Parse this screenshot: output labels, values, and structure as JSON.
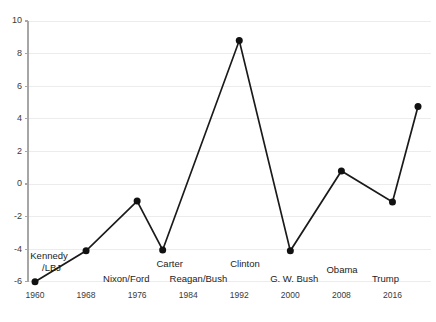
{
  "chart_data": {
    "type": "line",
    "title": "",
    "subtitle": "",
    "xlabel": "",
    "ylabel": "",
    "xlim": [
      1958,
      2022
    ],
    "ylim": [
      -6,
      10
    ],
    "grid": true,
    "legend": "none",
    "x_ticks": [
      "1960",
      "1968",
      "1976",
      "1984",
      "1992",
      "2000",
      "2008",
      "2016"
    ],
    "x_tick_values": [
      1960,
      1968,
      1976,
      1984,
      1992,
      2000,
      2008,
      2016
    ],
    "y_ticks": [
      "-6",
      "-4",
      "-2",
      "0",
      "2",
      "4",
      "6",
      "8",
      "10"
    ],
    "y_tick_values": [
      -6,
      -4,
      -2,
      0,
      2,
      4,
      6,
      8,
      10
    ],
    "x": [
      1960,
      1968,
      1976,
      1980,
      1992,
      2000,
      2008,
      2016,
      2020
    ],
    "values": [
      -6.0,
      -4.1,
      -1.05,
      -4.05,
      8.8,
      -4.1,
      0.8,
      -1.1,
      4.75
    ],
    "series": [
      {
        "name": "",
        "points": [
          {
            "x": 1960,
            "y": -6.0
          },
          {
            "x": 1968,
            "y": -4.1
          },
          {
            "x": 1976,
            "y": -1.05
          },
          {
            "x": 1980,
            "y": -4.05
          },
          {
            "x": 1992,
            "y": 8.8
          },
          {
            "x": 2000,
            "y": -4.1
          },
          {
            "x": 2008,
            "y": 0.8
          },
          {
            "x": 2016,
            "y": -1.1
          },
          {
            "x": 2020,
            "y": 4.75
          }
        ]
      }
    ],
    "annotations": [
      {
        "text": "Kennedy",
        "x": 1962.2,
        "y": -4.45
      },
      {
        "text": "/LBJ",
        "x": 1962.6,
        "y": -5.2
      },
      {
        "text": "Nixon/Ford",
        "x": 1974.3,
        "y": -5.85
      },
      {
        "text": "Carter",
        "x": 1981.1,
        "y": -4.95
      },
      {
        "text": "Reagan/Bush",
        "x": 1985.6,
        "y": -5.85
      },
      {
        "text": "Clinton",
        "x": 1992.9,
        "y": -4.95
      },
      {
        "text": "G. W. Bush",
        "x": 2000.6,
        "y": -5.85
      },
      {
        "text": "Obama",
        "x": 2008.1,
        "y": -5.3
      },
      {
        "text": "Trump",
        "x": 2014.9,
        "y": -5.85
      }
    ]
  }
}
